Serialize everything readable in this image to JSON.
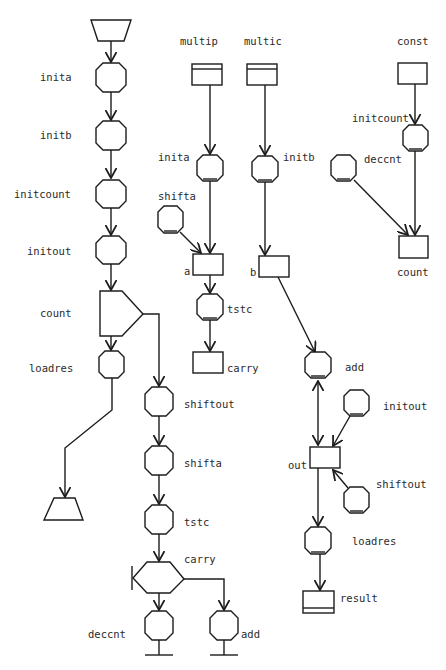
{
  "diagram": {
    "type": "petri-net-style control/data flow diagram",
    "colors": {
      "stroke": "#1c1c1c",
      "text": "#2a2a2a",
      "background": "#ffffff"
    },
    "control_flow": {
      "labels": {
        "inita": "inita",
        "initb": "initb",
        "initcount": "initcount",
        "initout": "initout",
        "count": "count",
        "loadres": "loadres",
        "shiftout": "shiftout",
        "shifta": "shifta",
        "tstc": "tstc",
        "carry": "carry",
        "deccnt": "deccnt",
        "add": "add"
      }
    },
    "data_flow": {
      "multip_column": {
        "source": "multip",
        "op1": "inita",
        "op2": "shifta",
        "register": "a",
        "test": "tstc",
        "output": "carry"
      },
      "multic_column": {
        "source": "multic",
        "op1": "initb",
        "register": "b"
      },
      "const_column": {
        "source": "const",
        "op1": "initcount",
        "op2": "deccnt",
        "register": "count"
      },
      "out_column": {
        "op_add": "add",
        "op_initout": "initout",
        "register": "out",
        "op_shiftout": "shiftout",
        "op_loadres": "loadres",
        "result": "result"
      }
    }
  }
}
